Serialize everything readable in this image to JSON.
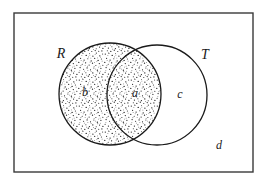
{
  "diagram": {
    "type": "venn",
    "universe": {
      "label": "d",
      "label_name": "universal-set-region-label",
      "description": "rectangle representing the universal set",
      "x": 14,
      "y": 13,
      "width": 239,
      "height": 159,
      "stroke": "#3a3a3a",
      "stroke_width": 1.4,
      "fill": "#ffffff"
    },
    "sets": [
      {
        "key": "R",
        "label": "R",
        "label_name": "set-label-r",
        "cx": 110,
        "cy": 94,
        "r": 51,
        "shaded": true,
        "label_x": 61,
        "label_y": 55,
        "stroke": "#1a1a1a",
        "stroke_width": 1.3
      },
      {
        "key": "T",
        "label": "T",
        "label_name": "set-label-t",
        "cx": 157,
        "cy": 95,
        "r": 50,
        "shaded": false,
        "label_x": 205,
        "label_y": 56,
        "stroke": "#1a1a1a",
        "stroke_width": 1.3
      }
    ],
    "regions": [
      {
        "key": "a",
        "label": "a",
        "label_name": "region-label-a",
        "meaning": "intersection of R and T",
        "shaded": true,
        "x": 135,
        "y": 94
      },
      {
        "key": "b",
        "label": "b",
        "label_name": "region-label-b",
        "meaning": "R only",
        "shaded": true,
        "x": 85,
        "y": 93
      },
      {
        "key": "c",
        "label": "c",
        "label_name": "region-label-c",
        "meaning": "T only",
        "shaded": false,
        "x": 180,
        "y": 95
      },
      {
        "key": "d",
        "label": "d",
        "label_name": "region-label-d",
        "meaning": "outside both R and T",
        "shaded": false,
        "x": 219,
        "y": 146
      }
    ],
    "shading": {
      "style": "stipple",
      "dot_color": "#111111",
      "background": "#ffffff",
      "density": "dense"
    }
  }
}
